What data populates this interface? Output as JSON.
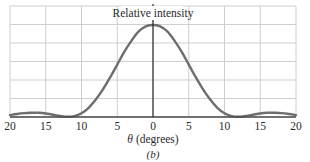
{
  "chart_data": {
    "type": "line",
    "title": "Relative intensity",
    "xlabel": "θ (degrees)",
    "subcaption": "(b)",
    "ylabel": "",
    "x_ticks": [
      -20,
      -15,
      -10,
      -5,
      0,
      5,
      10,
      15,
      20
    ],
    "x_tick_labels": [
      "20",
      "15",
      "10",
      "5",
      "0",
      "5",
      "10",
      "15",
      "20"
    ],
    "xlim": [
      -20,
      20
    ],
    "ylim": [
      0,
      1.2
    ],
    "grid": true,
    "horizontal_gridlines": 6,
    "legend": null,
    "series": [
      {
        "name": "Relative intensity",
        "x": [
          -20,
          -19,
          -18,
          -17,
          -16.5,
          -16,
          -15,
          -14,
          -13,
          -12,
          -11,
          -10,
          -9,
          -8,
          -7,
          -6,
          -5,
          -4,
          -3,
          -2,
          -1,
          0,
          1,
          2,
          3,
          4,
          5,
          6,
          7,
          8,
          9,
          10,
          11,
          12,
          13,
          14,
          15,
          16,
          16.5,
          17,
          18,
          19,
          20
        ],
        "y": [
          0.02,
          0.033,
          0.042,
          0.046,
          0.047,
          0.046,
          0.038,
          0.025,
          0.012,
          0.003,
          0.01,
          0.04,
          0.1,
          0.19,
          0.3,
          0.43,
          0.57,
          0.71,
          0.83,
          0.93,
          0.985,
          1.0,
          0.985,
          0.93,
          0.83,
          0.71,
          0.57,
          0.43,
          0.3,
          0.19,
          0.1,
          0.04,
          0.01,
          0.003,
          0.012,
          0.025,
          0.038,
          0.046,
          0.047,
          0.046,
          0.042,
          0.033,
          0.02
        ]
      }
    ],
    "colors": {
      "curve": "#6e6e6e",
      "grid": "#cfcfcf",
      "axis": "#1a1a1a",
      "baseline": "#4a4a4a"
    }
  }
}
